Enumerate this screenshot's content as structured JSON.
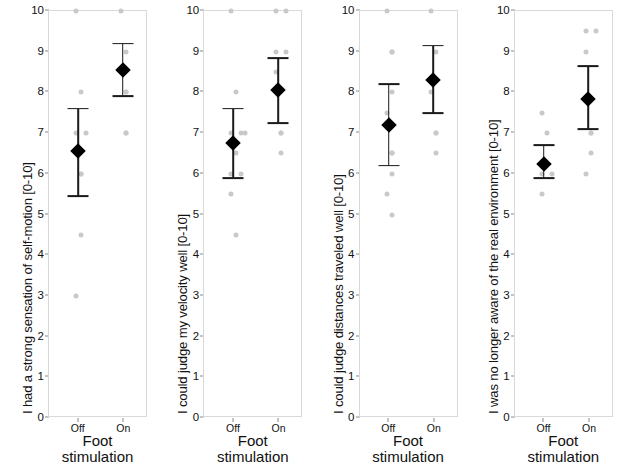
{
  "figure": {
    "axis": {
      "y_ticks": [
        0,
        1,
        2,
        3,
        4,
        5,
        6,
        7,
        8,
        9,
        10
      ],
      "y_min": 0,
      "y_max": 10,
      "x_categories": [
        "Off",
        "On"
      ],
      "x_title_line1": "Foot",
      "x_title_line2": "stimulation"
    },
    "colors": {
      "marker": "#000000",
      "errorbar": "#1a1a1a",
      "scatter": "#c9c9c9",
      "frame": "#d9d9d9",
      "text": "#111111"
    }
  },
  "chart_data": [
    {
      "type": "scatter",
      "title": "",
      "ylabel": "I had a strong sensation of self-motion [0-10]",
      "xlabel": "Foot stimulation",
      "categories": [
        "Off",
        "On"
      ],
      "ylim": [
        0,
        10
      ],
      "yticks": [
        0,
        1,
        2,
        3,
        4,
        5,
        6,
        7,
        8,
        9,
        10
      ],
      "grid": false,
      "legend": "none",
      "series": [
        {
          "name": "mean",
          "values": [
            6.55,
            8.55
          ],
          "ci_low": [
            5.45,
            7.9
          ],
          "ci_high": [
            7.6,
            9.2
          ]
        }
      ],
      "raw_points": {
        "Off": [
          10,
          8,
          7,
          7,
          6.5,
          6,
          6,
          4.5,
          3
        ],
        "On": [
          10,
          9,
          8.5,
          8,
          8,
          7,
          7
        ]
      }
    },
    {
      "type": "scatter",
      "title": "",
      "ylabel": "I could judge my velocity well [0-10]",
      "xlabel": "Foot stimulation",
      "categories": [
        "Off",
        "On"
      ],
      "ylim": [
        0,
        10
      ],
      "yticks": [
        0,
        1,
        2,
        3,
        4,
        5,
        6,
        7,
        8,
        9,
        10
      ],
      "grid": false,
      "legend": "none",
      "series": [
        {
          "name": "mean",
          "values": [
            6.75,
            8.05
          ],
          "ci_low": [
            5.9,
            7.25
          ],
          "ci_high": [
            7.6,
            8.85
          ]
        }
      ],
      "raw_points": {
        "Off": [
          10,
          8,
          7,
          7,
          7,
          6.5,
          6,
          6,
          5.5,
          4.5
        ],
        "On": [
          10,
          10,
          9,
          9,
          8.5,
          7,
          7,
          6.5
        ]
      }
    },
    {
      "type": "scatter",
      "title": "",
      "ylabel": "I could judge distances traveled well [0-10]",
      "xlabel": "Foot stimulation",
      "categories": [
        "Off",
        "On"
      ],
      "ylim": [
        0,
        10
      ],
      "yticks": [
        0,
        1,
        2,
        3,
        4,
        5,
        6,
        7,
        8,
        9,
        10
      ],
      "grid": false,
      "legend": "none",
      "series": [
        {
          "name": "mean",
          "values": [
            7.2,
            8.3
          ],
          "ci_low": [
            6.2,
            7.5
          ],
          "ci_high": [
            8.2,
            9.15
          ]
        }
      ],
      "raw_points": {
        "Off": [
          10,
          9,
          9,
          8,
          7.5,
          6.5,
          6.5,
          6,
          5.5,
          5
        ],
        "On": [
          10,
          9,
          8,
          7,
          7,
          6.5
        ]
      }
    },
    {
      "type": "scatter",
      "title": "",
      "ylabel": "I was no longer aware of the real environment [0-10]",
      "xlabel": "Foot stimulation",
      "categories": [
        "Off",
        "On"
      ],
      "ylim": [
        0,
        10
      ],
      "yticks": [
        0,
        1,
        2,
        3,
        4,
        5,
        6,
        7,
        8,
        9,
        10
      ],
      "grid": false,
      "legend": "none",
      "series": [
        {
          "name": "mean",
          "values": [
            6.25,
            7.85
          ],
          "ci_low": [
            5.9,
            7.1
          ],
          "ci_high": [
            6.7,
            8.65
          ]
        }
      ],
      "raw_points": {
        "Off": [
          7.5,
          7,
          6,
          6,
          5.5
        ],
        "On": [
          9.5,
          9.5,
          9,
          7,
          7,
          6.5,
          6
        ]
      }
    }
  ]
}
